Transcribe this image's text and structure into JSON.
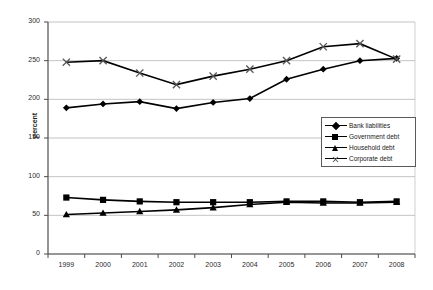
{
  "chart_data": {
    "type": "line",
    "title": "",
    "xlabel": "",
    "ylabel": "percent",
    "categories": [
      "1999",
      "2000",
      "2001",
      "2002",
      "2003",
      "2004",
      "2005",
      "2006",
      "2007",
      "2008"
    ],
    "ylim": [
      0,
      300
    ],
    "yticks": [
      0,
      50,
      100,
      150,
      200,
      250,
      300
    ],
    "grid": true,
    "legend_position": "center-right",
    "series": [
      {
        "name": "Bank  liabilities",
        "marker": "diamond",
        "values": [
          189,
          194,
          197,
          188,
          196,
          201,
          226,
          239,
          250,
          253
        ]
      },
      {
        "name": "Government debt",
        "marker": "square",
        "values": [
          73,
          70,
          68,
          67,
          67,
          67,
          68,
          68,
          67,
          68
        ]
      },
      {
        "name": "Household debt",
        "marker": "triangle",
        "values": [
          51,
          53,
          55,
          57,
          60,
          64,
          67,
          66,
          66,
          67
        ]
      },
      {
        "name": "Corporate debt",
        "marker": "cross",
        "values": [
          248,
          250,
          234,
          219,
          230,
          239,
          250,
          268,
          272,
          252
        ]
      }
    ]
  },
  "axis": {
    "y_title": "percent",
    "y_tick_labels": [
      "300",
      "250",
      "200",
      "150",
      "100",
      "50",
      "0"
    ],
    "x_tick_labels": [
      "1999",
      "2000",
      "2001",
      "2002",
      "2003",
      "2004",
      "2005",
      "2006",
      "2007",
      "2008"
    ]
  },
  "legend": {
    "items": [
      {
        "label": "Bank  liabilities",
        "marker": "diamond-marker"
      },
      {
        "label": "Government debt",
        "marker": "square-marker"
      },
      {
        "label": "Household debt",
        "marker": "triangle-marker"
      },
      {
        "label": "Corporate debt",
        "marker": "cross-marker"
      }
    ]
  },
  "colors": {
    "line": "#000000",
    "grid": "#aaaaaa",
    "axis": "#4d4d4d",
    "text": "#2b2b2b",
    "background": "#ffffff"
  }
}
